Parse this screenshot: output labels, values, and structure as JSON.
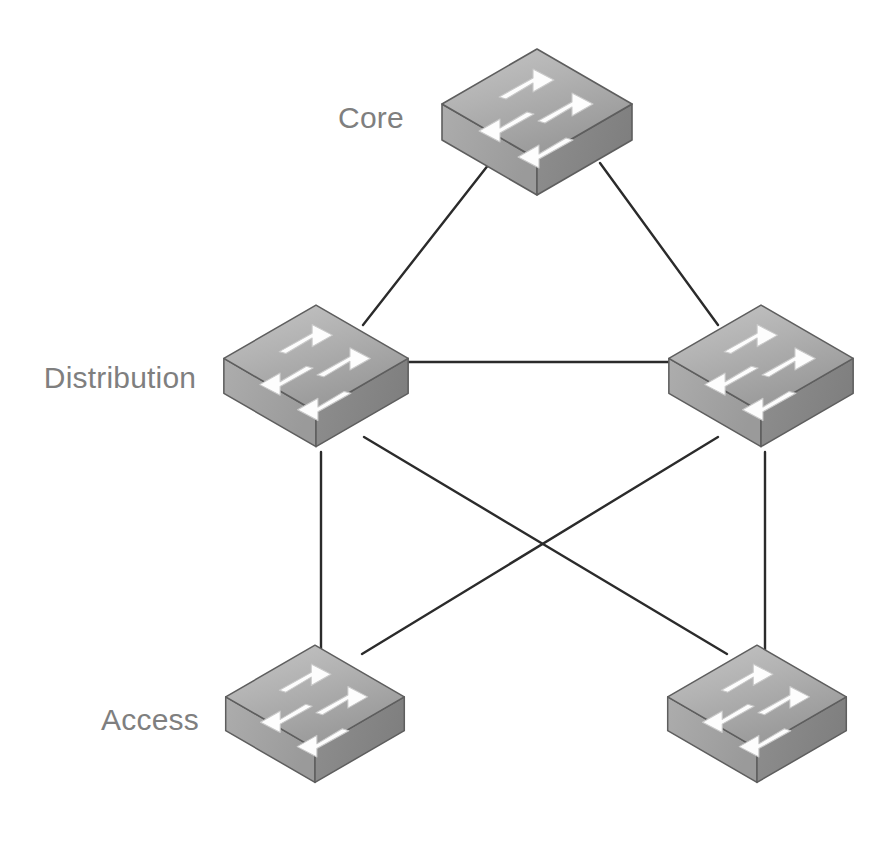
{
  "diagram": {
    "type": "network-topology",
    "width": 893,
    "height": 842,
    "background_color": "#ffffff"
  },
  "tiers": [
    {
      "id": "core",
      "label": "Core",
      "label_x": 371,
      "label_y": 118
    },
    {
      "id": "distribution",
      "label": "Distribution",
      "label_x": 120,
      "label_y": 378
    },
    {
      "id": "access",
      "label": "Access",
      "label_x": 150,
      "label_y": 720
    }
  ],
  "nodes": [
    {
      "id": "core-switch",
      "tier": "core",
      "device": "switch",
      "x": 537,
      "y": 118,
      "scale": 1.0
    },
    {
      "id": "dist-switch-left",
      "tier": "distribution",
      "device": "switch",
      "x": 316,
      "y": 372,
      "scale": 0.97
    },
    {
      "id": "dist-switch-right",
      "tier": "distribution",
      "device": "switch",
      "x": 761,
      "y": 372,
      "scale": 0.97
    },
    {
      "id": "access-switch-left",
      "tier": "access",
      "device": "switch",
      "x": 315,
      "y": 710,
      "scale": 0.94
    },
    {
      "id": "access-switch-right",
      "tier": "access",
      "device": "switch",
      "x": 757,
      "y": 710,
      "scale": 0.94
    }
  ],
  "links": [
    {
      "id": "link-core-distleft",
      "from": "core-switch",
      "to": "dist-switch-left",
      "x1": 489,
      "y1": 164,
      "x2": 363,
      "y2": 325
    },
    {
      "id": "link-core-distright",
      "from": "core-switch",
      "to": "dist-switch-right",
      "x1": 600,
      "y1": 163,
      "x2": 718,
      "y2": 325
    },
    {
      "id": "link-dist-dist",
      "from": "dist-switch-left",
      "to": "dist-switch-right",
      "x1": 401,
      "y1": 362,
      "x2": 673,
      "y2": 362
    },
    {
      "id": "link-distleft-accleft",
      "from": "dist-switch-left",
      "to": "access-switch-left",
      "x1": 321,
      "y1": 452,
      "x2": 321,
      "y2": 652
    },
    {
      "id": "link-distright-accright",
      "from": "dist-switch-right",
      "to": "access-switch-right",
      "x1": 765,
      "y1": 452,
      "x2": 765,
      "y2": 652
    },
    {
      "id": "link-distleft-accright",
      "from": "dist-switch-left",
      "to": "access-switch-right",
      "x1": 364,
      "y1": 437,
      "x2": 727,
      "y2": 654
    },
    {
      "id": "link-distright-accleft",
      "from": "dist-switch-right",
      "to": "access-switch-left",
      "x1": 718,
      "y1": 437,
      "x2": 362,
      "y2": 654
    }
  ],
  "style": {
    "link_color": "#2b2b2b",
    "link_width": 2.4,
    "label_color": "#7f7f7f",
    "label_font_size": 30,
    "switch_top_light": "#bdbdbd",
    "switch_top_dark": "#9c9c9c",
    "switch_left_face": "#a3a3a3",
    "switch_right_face": "#888888",
    "switch_outline": "#5c5c5c",
    "arrow_fill": "#fdfdfd",
    "arrow_outline": "#bfbfbf"
  },
  "icon_names": {
    "switch": "network-switch-icon",
    "arrows": "bidirectional-switch-arrows-icon"
  }
}
